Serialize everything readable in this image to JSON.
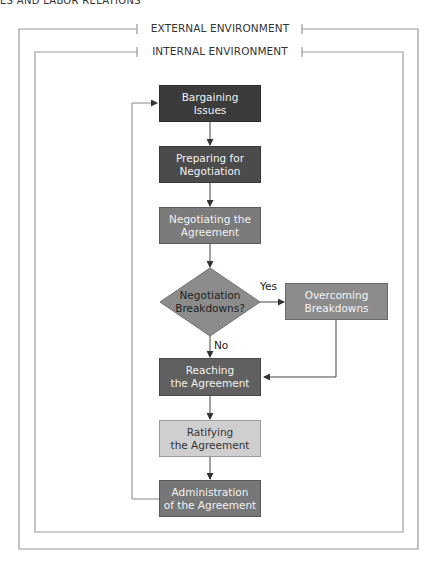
{
  "page_header": "ES AND LABOR RELATIONS",
  "frames": {
    "external": {
      "title": "EXTERNAL ENVIRONMENT"
    },
    "internal": {
      "title": "INTERNAL ENVIRONMENT"
    }
  },
  "nodes": {
    "bargaining_issues": {
      "label": "Bargaining\nIssues",
      "color": "#3b3b3b"
    },
    "preparing": {
      "label": "Preparing for\nNegotiation",
      "color": "#4b4b4b"
    },
    "negotiating": {
      "label": "Negotiating the\nAgreement",
      "color": "#7b7b7b"
    },
    "decision": {
      "label": "Negotiation\nBreakdowns?",
      "color": "#8c8c8c"
    },
    "overcoming": {
      "label": "Overcoming\nBreakdowns",
      "color": "#8c8c8c"
    },
    "reaching": {
      "label": "Reaching\nthe Agreement",
      "color": "#606060"
    },
    "ratifying": {
      "label": "Ratifying\nthe Agreement",
      "color": "#cfcfcf"
    },
    "administration": {
      "label": "Administration\nof the Agreement",
      "color": "#777777"
    }
  },
  "edges": {
    "yes_label": "Yes",
    "no_label": "No"
  },
  "colors": {
    "frame_line": "#9a9a9a",
    "connector": "#444444"
  }
}
